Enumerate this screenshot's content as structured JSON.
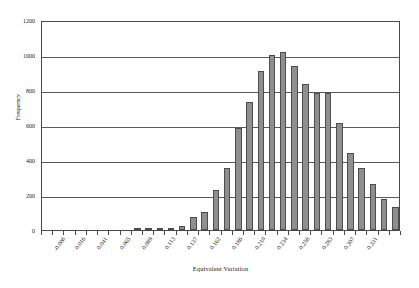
{
  "chart_data": {
    "type": "bar",
    "title": "",
    "xlabel": "Equivalent Variation",
    "ylabel": "Frequency",
    "ylim": [
      0,
      1200
    ],
    "yticks": [
      0,
      200,
      400,
      600,
      800,
      1000,
      1200
    ],
    "grid": true,
    "legend": "none",
    "bin_width": 0.01225,
    "categories": [
      "-0.008",
      "0.004",
      "0.016",
      "0.029",
      "0.041",
      "0.053",
      "0.065",
      "0.077",
      "0.089",
      "0.101",
      "0.113",
      "0.125",
      "0.137",
      "0.150",
      "0.162",
      "0.174",
      "0.186",
      "0.198",
      "0.210",
      "0.222",
      "0.234",
      "0.246",
      "0.258",
      "0.270",
      "0.283",
      "0.295",
      "0.307",
      "0.319",
      "0.331"
    ],
    "tick_labels": [
      "-0.008",
      "0.016",
      "0.041",
      "0.065",
      "0.089",
      "0.113",
      "0.137",
      "0.162",
      "0.186",
      "0.210",
      "0.234",
      "0.258",
      "0.283",
      "0.307",
      "0.331"
    ],
    "values": [
      0,
      0,
      0,
      0,
      0,
      0,
      0,
      0,
      4,
      5,
      6,
      14,
      22,
      77,
      105,
      230,
      355,
      585,
      730,
      910,
      1000,
      1020,
      935,
      835,
      785,
      785,
      610,
      440,
      355
    ],
    "values_tail": [
      265,
      180,
      130
    ],
    "bar_color": "#8f8f8f",
    "bar_border_color": "#4d4d4d",
    "axis_color": "#4a4a4a"
  }
}
